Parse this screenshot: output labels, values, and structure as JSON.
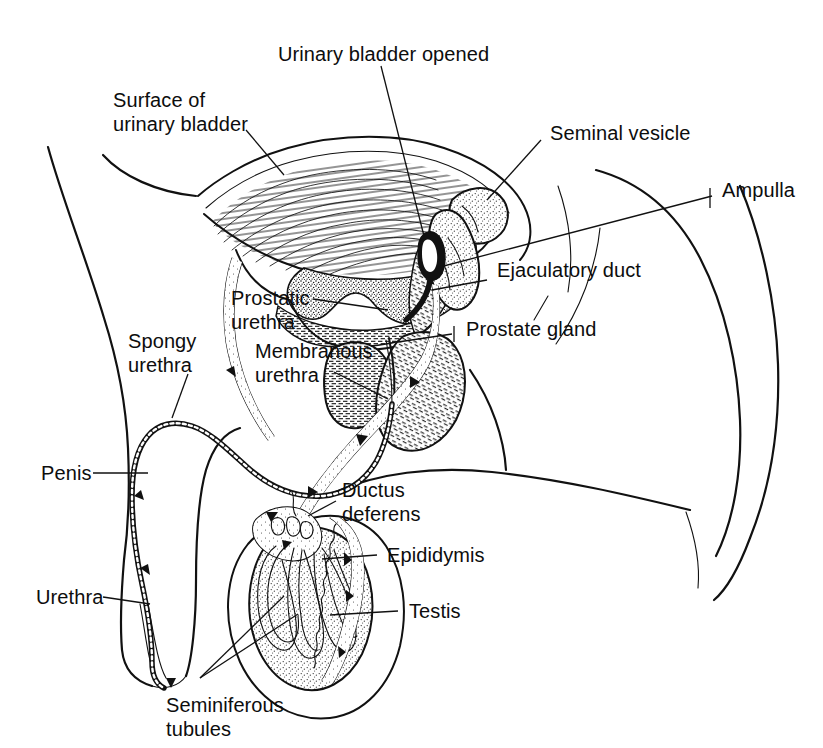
{
  "figure": {
    "ink_color": "#111111",
    "background_color": "#ffffff"
  },
  "labels": {
    "urinary_bladder_opened": "Urinary bladder opened",
    "surface_of_urinary_bladder_line1": "Surface of",
    "surface_of_urinary_bladder_line2": "urinary bladder",
    "seminal_vesicle": "Seminal vesicle",
    "ampulla": "Ampulla",
    "ejaculatory_duct": "Ejaculatory duct",
    "prostate_gland": "Prostate gland",
    "prostatic_urethra_line1": "Prostatic",
    "prostatic_urethra_line2": "urethra",
    "membranous_urethra_line1": "Membranous",
    "membranous_urethra_line2": "urethra",
    "spongy_urethra_line1": "Spongy",
    "spongy_urethra_line2": "urethra",
    "penis": "Penis",
    "urethra": "Urethra",
    "ductus_deferens_line1": "Ductus",
    "ductus_deferens_line2": "deferens",
    "epididymis": "Epididymis",
    "testis": "Testis",
    "seminiferous_tubules_line1": "Seminiferous",
    "seminiferous_tubules_line2": "tubules"
  }
}
